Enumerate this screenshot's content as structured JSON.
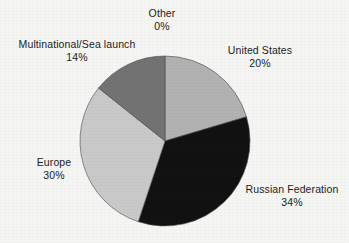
{
  "chart_data": {
    "type": "pie",
    "title": "",
    "subtitle": "",
    "xlabel": "",
    "ylabel": "",
    "legend_position": "none",
    "grid": false,
    "labels_outside": true,
    "start_angle_deg": 0,
    "direction": "clockwise",
    "categories": [
      "United States",
      "Russian Federation",
      "Europe",
      "Multinational/Sea launch",
      "Other"
    ],
    "values": [
      20,
      34,
      30,
      14,
      0
    ],
    "value_suffix": "%",
    "slices": [
      {
        "name": "United States",
        "value": 20,
        "label": "20%",
        "color": "#b2b2b2"
      },
      {
        "name": "Russian Federation",
        "value": 34,
        "label": "34%",
        "color": "#121212"
      },
      {
        "name": "Europe",
        "value": 30,
        "label": "30%",
        "color": "#c9c9c9"
      },
      {
        "name": "Multinational/Sea launch",
        "value": 14,
        "label": "14%",
        "color": "#737373"
      },
      {
        "name": "Other",
        "value": 0,
        "label": "0%",
        "color": "#8f8f8f"
      }
    ]
  },
  "labels": {
    "other": {
      "name": "Other",
      "value": "0%"
    },
    "multinational": {
      "name": "Multinational/Sea launch",
      "value": "14%"
    },
    "united_states": {
      "name": "United States",
      "value": "20%"
    },
    "russian": {
      "name": "Russian Federation",
      "value": "34%"
    },
    "europe": {
      "name": "Europe",
      "value": "30%"
    }
  },
  "colors": {
    "background": "#f5f5f3",
    "text": "#1c1c1c",
    "united_states": "#b2b2b2",
    "russian_federation": "#121212",
    "europe": "#c9c9c9",
    "multinational": "#737373",
    "other": "#8f8f8f",
    "slice_outline": "#4a4a4a"
  },
  "geometry": {
    "center_x": 165,
    "center_y": 141,
    "radius": 85
  }
}
